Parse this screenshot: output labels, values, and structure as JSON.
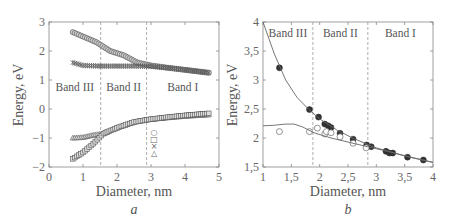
{
  "panels": {
    "a": {
      "caption": "a",
      "xlabel": "Diameter, nm",
      "ylabel": "Energy, eV",
      "bands": [
        "Band III",
        "Band II",
        "Band I"
      ],
      "legend_symbols": [
        "○",
        "□",
        "×",
        "△"
      ]
    },
    "b": {
      "caption": "b",
      "xlabel": "Diameter, nm",
      "ylabel": "Energy, eV",
      "bands": [
        "Band III",
        "Band II",
        "Band I"
      ]
    }
  },
  "chart_data": [
    {
      "type": "scatter",
      "title": "",
      "caption": "a",
      "xlabel": "Diameter, nm",
      "ylabel": "Energy, eV",
      "xlim": [
        0,
        5
      ],
      "ylim": [
        -2,
        3
      ],
      "xticks": [
        0,
        1,
        2,
        3,
        4,
        5
      ],
      "yticks": [
        -2,
        -1,
        0,
        1,
        2,
        3
      ],
      "vlines": [
        1.52,
        2.87
      ],
      "annotations": [
        "Band III",
        "Band II",
        "Band I"
      ],
      "legend": [
        "○",
        "□",
        "×",
        "△"
      ],
      "grid": false,
      "series": [
        {
          "name": "circles",
          "marker": "o",
          "x": [
            0.7,
            1.0,
            1.4,
            1.8,
            2.2,
            2.6,
            3.0,
            3.5,
            4.0,
            4.7
          ],
          "y": [
            2.65,
            2.5,
            2.3,
            2.0,
            1.85,
            1.6,
            1.5,
            1.42,
            1.35,
            1.25
          ]
        },
        {
          "name": "crosses",
          "marker": "x",
          "x": [
            0.7,
            1.0,
            1.5,
            2.0,
            2.5,
            3.0,
            3.5,
            4.0,
            4.7
          ],
          "y": [
            1.6,
            1.5,
            1.48,
            1.48,
            1.48,
            1.47,
            1.42,
            1.35,
            1.25
          ]
        },
        {
          "name": "triangles",
          "marker": "^",
          "x": [
            0.7,
            1.0,
            1.3,
            1.6,
            2.0,
            2.5,
            2.9,
            3.5,
            4.0,
            4.7
          ],
          "y": [
            -1.0,
            -0.98,
            -0.9,
            -0.85,
            -0.65,
            -0.45,
            -0.37,
            -0.3,
            -0.25,
            -0.2
          ]
        },
        {
          "name": "squares",
          "marker": "s",
          "x": [
            0.7,
            1.0,
            1.3,
            1.6,
            2.0,
            2.5,
            3.0,
            3.5,
            4.0,
            4.7
          ],
          "y": [
            -1.72,
            -1.5,
            -1.2,
            -0.85,
            -0.65,
            -0.45,
            -0.35,
            -0.28,
            -0.22,
            -0.15
          ]
        }
      ]
    },
    {
      "type": "scatter",
      "title": "",
      "caption": "b",
      "xlabel": "Diameter, nm",
      "ylabel": "Energy, eV",
      "xlim": [
        1,
        4
      ],
      "ylim": [
        1.5,
        4
      ],
      "xticks": [
        "1",
        "1,5",
        "2",
        "2,5",
        "3",
        "3,5",
        "4"
      ],
      "yticks": [
        "1,5",
        "2",
        "2,5",
        "3",
        "3,5",
        "4"
      ],
      "vlines": [
        1.88,
        2.85
      ],
      "annotations": [
        "Band III",
        "Band II",
        "Band I"
      ],
      "grid": false,
      "series": [
        {
          "name": "filled",
          "marker": "filled-circle",
          "x": [
            1.29,
            1.82,
            1.98,
            2.09,
            2.15,
            2.2,
            2.36,
            2.59,
            2.83,
            2.91,
            3.17,
            3.23,
            3.29,
            3.55,
            3.83
          ],
          "y": [
            3.21,
            2.49,
            2.36,
            2.24,
            2.21,
            2.18,
            2.08,
            1.98,
            1.88,
            1.85,
            1.77,
            1.74,
            1.74,
            1.67,
            1.62
          ]
        },
        {
          "name": "open",
          "marker": "open-circle",
          "x": [
            1.29,
            1.82,
            1.96,
            2.09,
            2.12,
            2.2,
            2.36,
            2.59,
            2.82
          ],
          "y": [
            2.11,
            2.11,
            2.17,
            2.07,
            2.11,
            2.09,
            2.02,
            1.91,
            1.83
          ]
        },
        {
          "name": "upper-fit",
          "marker": "line",
          "x": [
            1.0,
            1.2,
            1.4,
            1.6,
            1.8,
            2.0,
            2.3,
            2.6,
            3.0,
            3.5,
            4.0
          ],
          "y": [
            4.0,
            3.45,
            3.0,
            2.7,
            2.5,
            2.33,
            2.14,
            1.99,
            1.83,
            1.69,
            1.58
          ]
        },
        {
          "name": "lower-fit",
          "marker": "line",
          "x": [
            1.0,
            1.2,
            1.4,
            1.55,
            1.7,
            1.9,
            2.2,
            2.5,
            2.8,
            3.2,
            3.6,
            4.0
          ],
          "y": [
            2.21,
            2.22,
            2.24,
            2.24,
            2.19,
            2.09,
            2.0,
            1.93,
            1.86,
            1.77,
            1.67,
            1.58
          ]
        }
      ]
    }
  ]
}
